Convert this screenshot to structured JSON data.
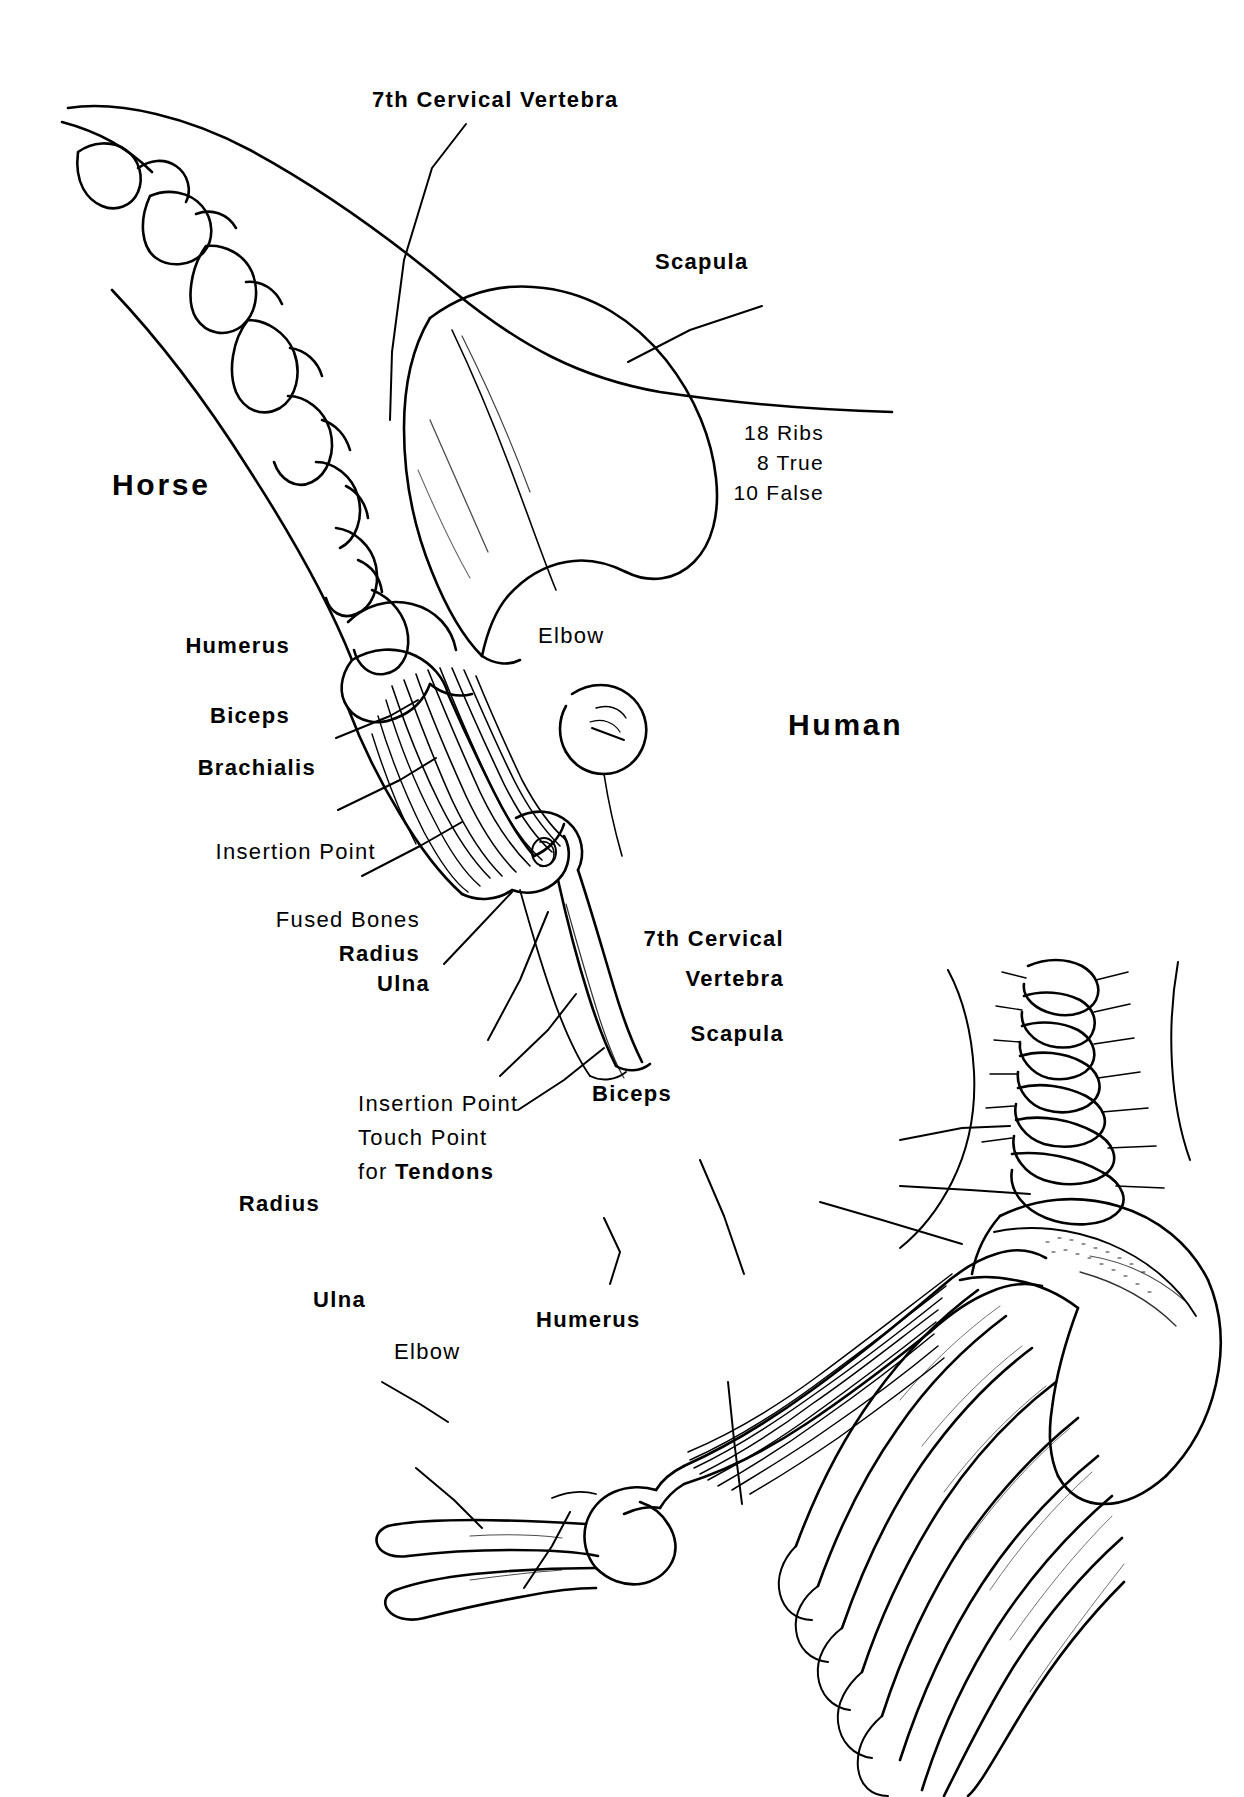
{
  "figure": {
    "title_horse": "Horse",
    "title_human": "Human",
    "type": "anatomical-comparison-diagram",
    "ink_color": "#000000",
    "background_color": "#ffffff"
  },
  "notes": {
    "ribs_line1": "18 Ribs",
    "ribs_line2": "8 True",
    "ribs_line3": "10 False"
  },
  "horse_labels": {
    "cervical": "7th Cervical Vertebra",
    "scapula": "Scapula",
    "humerus": "Humerus",
    "biceps": "Biceps",
    "brachialis": "Brachialis",
    "insertion_point": "Insertion Point",
    "fused_bones": "Fused Bones",
    "radius": "Radius",
    "ulna": "Ulna",
    "elbow": "Elbow"
  },
  "human_labels": {
    "cervical_line1": "7th Cervical",
    "cervical_line2": "Vertebra",
    "scapula": "Scapula",
    "biceps": "Biceps",
    "humerus": "Humerus",
    "insertion_line1": "Insertion Point",
    "insertion_line2": "Touch Point",
    "insertion_line3_prefix": "for ",
    "insertion_line3_bold": "Tendons",
    "radius": "Radius",
    "ulna": "Ulna",
    "elbow": "Elbow"
  }
}
